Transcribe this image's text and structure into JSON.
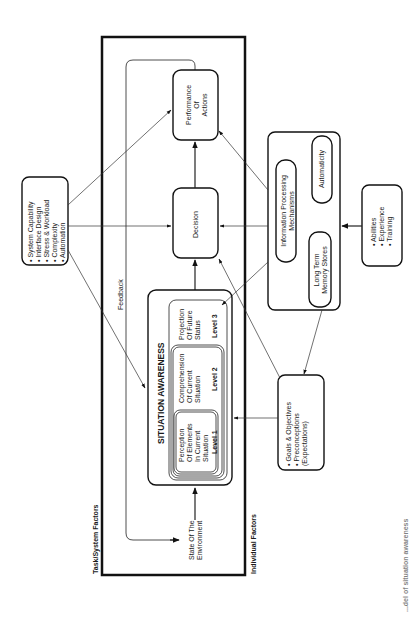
{
  "diagram": {
    "title_task": "Task/System Factors",
    "title_individual": "Individual Factors",
    "state_env": [
      "State Of The",
      "Environment"
    ],
    "feedback": "Feedback",
    "situation_awareness": {
      "title": "SITUATION AWARENESS",
      "level1": {
        "text": [
          "Perception",
          "Of Elements",
          "In Current",
          "Situation"
        ],
        "label": "Level 1"
      },
      "level2": {
        "text": [
          "Comprehension",
          "Of Current",
          "Situation"
        ],
        "label": "Level 2"
      },
      "level3": {
        "text": [
          "Projection",
          "Of Future",
          "Status"
        ],
        "label": "Level 3"
      }
    },
    "decision": "Decision",
    "performance": [
      "Performance",
      "Of",
      "Actions"
    ],
    "system_factors": [
      "• System Capability",
      "• Interface Design",
      "• Stress & Workload",
      "• Complexity",
      "• Automation"
    ],
    "info_processing": {
      "ipm": [
        "Information Processing",
        "Mechanisms"
      ],
      "ltm": [
        "Long Term",
        "Memory Stores"
      ],
      "automaticity": "Automaticity"
    },
    "abilities": [
      "• Abilities",
      "• Experience",
      "• Training"
    ],
    "goals": [
      "• Goals & Objectives",
      "• Preconceptions",
      "  (Expectations)"
    ],
    "caption": "...del of situation awareness"
  }
}
